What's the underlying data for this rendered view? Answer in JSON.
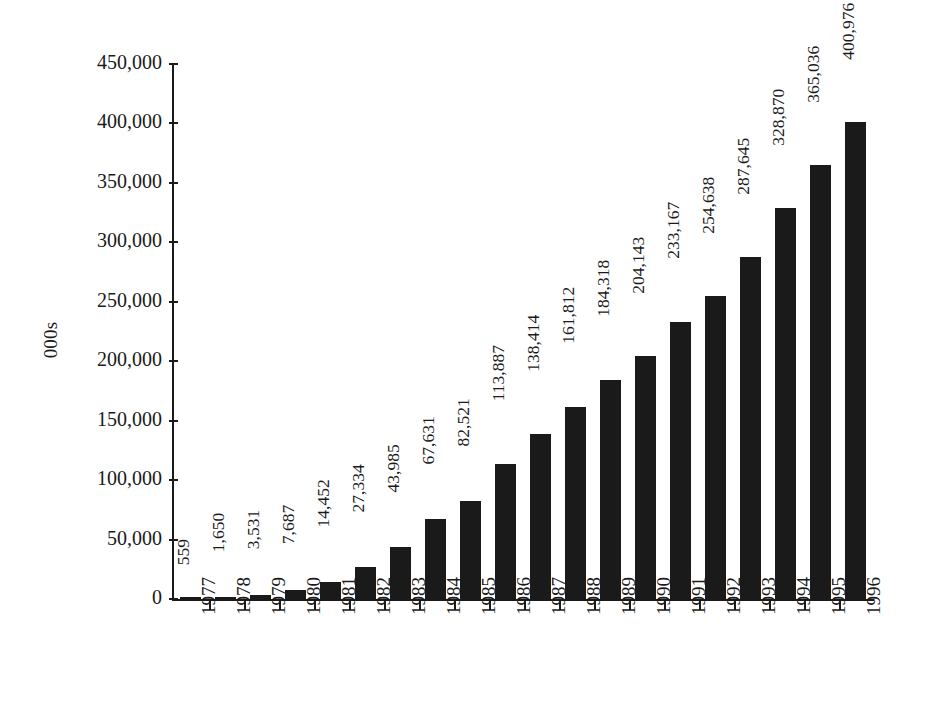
{
  "chart_data": {
    "type": "bar",
    "title": "",
    "subtitle": "",
    "xlabel": "",
    "ylabel": "000s",
    "ylim": [
      0,
      450000
    ],
    "ytick_step": 50000,
    "grid": false,
    "legend": false,
    "bar_color": "#1a1a1a",
    "background_color": "#ffffff",
    "value_labels_rotated": true,
    "category_labels_rotated": true,
    "categories": [
      "1977",
      "1978",
      "1979",
      "1980",
      "1981",
      "1982",
      "1983",
      "1984",
      "1985",
      "1986",
      "1987",
      "1988",
      "1989",
      "1990",
      "1991",
      "1992",
      "1993",
      "1994",
      "1995",
      "1996"
    ],
    "values": [
      559,
      1650,
      3531,
      7687,
      14452,
      27334,
      43985,
      67631,
      82521,
      113887,
      138414,
      161812,
      184318,
      204143,
      233167,
      254638,
      287645,
      328870,
      365036,
      400976
    ],
    "value_labels": [
      "559",
      "1,650",
      "3,531",
      "7,687",
      "14,452",
      "27,334",
      "43,985",
      "67,631",
      "82,521",
      "113,887",
      "138,414",
      "161,812",
      "184,318",
      "204,143",
      "233,167",
      "254,638",
      "287,645",
      "328,870",
      "365,036",
      "400,976"
    ],
    "ytick_values": [
      0,
      50000,
      100000,
      150000,
      200000,
      250000,
      300000,
      350000,
      400000,
      450000
    ],
    "ytick_labels": [
      "0",
      "50,000",
      "100,000",
      "150,000",
      "200,000",
      "250,000",
      "300,000",
      "350,000",
      "400,000",
      "450,000"
    ]
  }
}
